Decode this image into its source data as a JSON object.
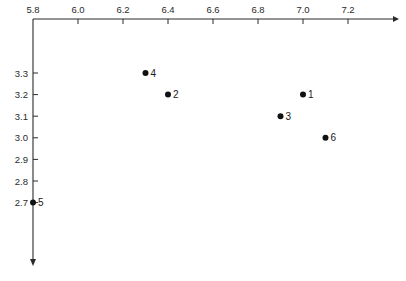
{
  "chart_data": {
    "type": "scatter",
    "title": "",
    "xlabel": "",
    "ylabel": "",
    "x_axis_position": "top",
    "y_axis_direction": "down",
    "xlim": [
      5.8,
      7.4
    ],
    "ylim": [
      3.4,
      2.4
    ],
    "x_ticks": [
      "5.8",
      "6.0",
      "6.2",
      "6.4",
      "6.6",
      "6.8",
      "7.0",
      "7.2"
    ],
    "y_ticks": [
      "3.3",
      "3.2",
      "3.1",
      "3.0",
      "2.9",
      "2.8",
      "2.7"
    ],
    "grid": false,
    "legend": null,
    "points": [
      {
        "label": "1",
        "x": 7.0,
        "y": 3.2
      },
      {
        "label": "2",
        "x": 6.4,
        "y": 3.2
      },
      {
        "label": "3",
        "x": 6.9,
        "y": 3.1
      },
      {
        "label": "4",
        "x": 6.3,
        "y": 3.3
      },
      {
        "label": "5",
        "x": 5.8,
        "y": 2.7
      },
      {
        "label": "6",
        "x": 7.1,
        "y": 3.0
      }
    ]
  },
  "colors": {
    "axis": "#2a2a2a",
    "point": "#111111"
  }
}
